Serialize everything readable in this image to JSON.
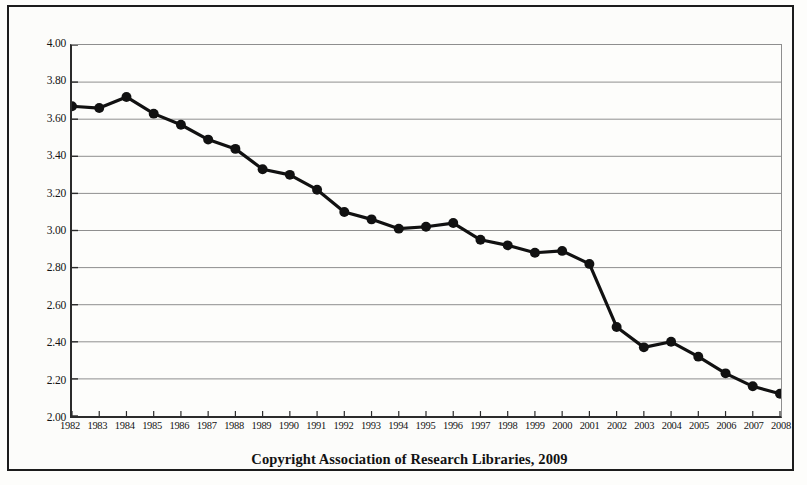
{
  "caption": "Copyright Association of Research Libraries, 2009",
  "axis": {
    "y_tick_labels": [
      "4.00",
      "3.80",
      "3.60",
      "3.40",
      "3.20",
      "3.00",
      "2.80",
      "2.60",
      "2.40",
      "2.20",
      "2.00"
    ],
    "x_tick_labels": [
      "1982",
      "1983",
      "1984",
      "1985",
      "1986",
      "1987",
      "1988",
      "1989",
      "1990",
      "1991",
      "1992",
      "1993",
      "1994",
      "1995",
      "1996",
      "1997",
      "1998",
      "1999",
      "2000",
      "2001",
      "2002",
      "2003",
      "2004",
      "2005",
      "2006",
      "2007",
      "2008"
    ]
  },
  "style": {
    "line_color": "#111111",
    "marker_color": "#111111",
    "grid_color": "#8e8e8e",
    "axis_color": "#2b2b2b",
    "background": "#fdfdfb",
    "frame_color": "#1c1c1c"
  },
  "chart_data": {
    "type": "line",
    "title": "",
    "subtitle": "",
    "xlabel": "",
    "ylabel": "",
    "xlim": [
      1982,
      2008
    ],
    "ylim": [
      2.0,
      4.0
    ],
    "y_tick_step": 0.2,
    "grid": true,
    "legend": false,
    "legend_position": "none",
    "annotations": [
      "Copyright Association of Research Libraries, 2009"
    ],
    "categories": [
      1982,
      1983,
      1984,
      1985,
      1986,
      1987,
      1988,
      1989,
      1990,
      1991,
      1992,
      1993,
      1994,
      1995,
      1996,
      1997,
      1998,
      1999,
      2000,
      2001,
      2002,
      2003,
      2004,
      2005,
      2006,
      2007,
      2008
    ],
    "values": [
      3.67,
      3.66,
      3.72,
      3.63,
      3.57,
      3.49,
      3.44,
      3.33,
      3.3,
      3.22,
      3.1,
      3.06,
      3.01,
      3.02,
      3.04,
      2.95,
      2.92,
      2.88,
      2.89,
      2.82,
      2.48,
      2.37,
      2.4,
      2.32,
      2.23,
      2.16,
      2.12
    ],
    "series": [
      {
        "name": "",
        "values": [
          3.67,
          3.66,
          3.72,
          3.63,
          3.57,
          3.49,
          3.44,
          3.33,
          3.3,
          3.22,
          3.1,
          3.06,
          3.01,
          3.02,
          3.04,
          2.95,
          2.92,
          2.88,
          2.89,
          2.82,
          2.48,
          2.37,
          2.4,
          2.32,
          2.23,
          2.16,
          2.12
        ]
      }
    ]
  }
}
